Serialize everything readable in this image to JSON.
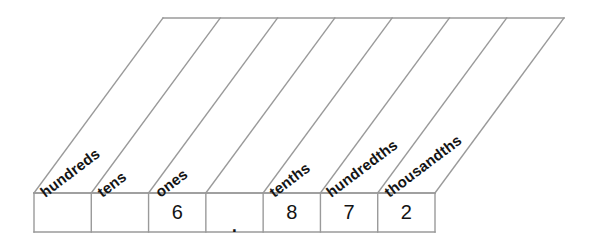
{
  "chart_data": {
    "type": "table",
    "orientation": "skewed-header-place-value-chart",
    "columns": [
      {
        "label": "hundreds",
        "value": "",
        "place": "hundreds",
        "has_label": true
      },
      {
        "label": "tens",
        "value": "",
        "place": "tens",
        "has_label": true
      },
      {
        "label": "ones",
        "value": "6",
        "place": "ones",
        "has_label": true
      },
      {
        "label": "",
        "value": ".",
        "place": "decimal-point",
        "has_label": false
      },
      {
        "label": "tenths",
        "value": "8",
        "place": "tenths",
        "has_label": true
      },
      {
        "label": "hundredths",
        "value": "7",
        "place": "hundredths",
        "has_label": true
      },
      {
        "label": "thousandths",
        "value": "2",
        "place": "thousandths",
        "has_label": true
      }
    ],
    "number_shown": "6.872",
    "headers": [
      "hundreds",
      "tens",
      "ones",
      "",
      "tenths",
      "hundredths",
      "thousandths"
    ],
    "values": [
      "",
      "",
      "6",
      ".",
      "8",
      "7",
      "2"
    ]
  },
  "style": {
    "line_color": "#9a9a9a",
    "text_color": "#141414",
    "background": "#ffffff",
    "label_rotation_deg": -37,
    "skew_offset_px": 129
  }
}
